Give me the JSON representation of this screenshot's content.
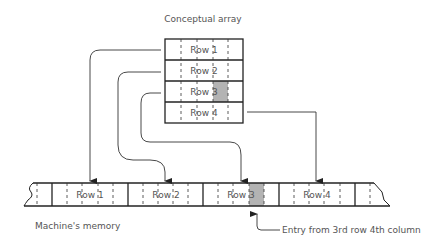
{
  "title": "Conceptual array",
  "memory_label": "Machine's memory",
  "annotation": "Entry from 3rd row 4th column",
  "array_rows": [
    {
      "label": "Row 1"
    },
    {
      "label": "Row 2"
    },
    {
      "label": "Row 3",
      "highlight_col": 4
    },
    {
      "label": "Row 4"
    }
  ],
  "memory_rows": [
    "Row 1",
    "Row 2",
    "Row 3",
    "Row 4"
  ],
  "colors": {
    "line": "#333333",
    "text": "#555555",
    "highlight": "#b3b3b3"
  }
}
